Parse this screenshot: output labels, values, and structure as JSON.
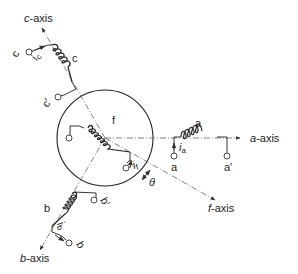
{
  "figure": {
    "axes": {
      "a_axis": "a-axis",
      "b_axis": "b-axis",
      "c_axis": "c-axis",
      "f_axis": "f-axis"
    },
    "windings": {
      "a": {
        "label": "a",
        "terminal_start": "a",
        "terminal_end": "a′",
        "current": "i",
        "current_sub": "a"
      },
      "b": {
        "label": "b",
        "terminal_start": "b",
        "terminal_end": "b′",
        "current": "i",
        "current_sub": "b"
      },
      "c": {
        "label": "c",
        "terminal_start": "c",
        "terminal_end": "c′",
        "current": "i",
        "current_sub": "c"
      },
      "f": {
        "label": "f",
        "current": "i",
        "current_sub": "f"
      }
    },
    "angle_label": "θ",
    "colors": {
      "ink": "#222222",
      "axis_line": "#666666",
      "background": "#ffffff"
    }
  }
}
